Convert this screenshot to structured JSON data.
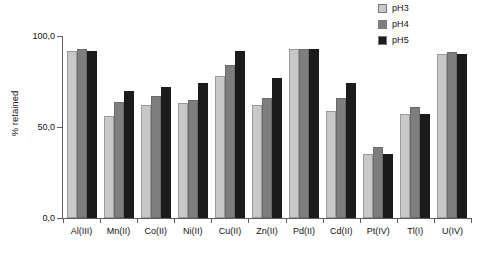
{
  "chart_data": {
    "type": "bar",
    "title": "",
    "xlabel": "",
    "ylabel": "% retained",
    "ylim": [
      0,
      100
    ],
    "ytick_labels": [
      "100,0",
      "50,0",
      "0,0"
    ],
    "ytick_values": [
      100,
      50,
      0
    ],
    "grid": false,
    "legend_position": "top-right",
    "categories": [
      "Al(III)",
      "Mn(II)",
      "Co(II)",
      "Ni(II)",
      "Cu(II)",
      "Zn(II)",
      "Pd(II)",
      "Cd(II)",
      "Pt(IV)",
      "Tl(I)",
      "U(IV)"
    ],
    "series": [
      {
        "name": "pH3",
        "color": "#c8c8c8",
        "values": [
          92,
          56,
          62,
          63,
          78,
          62,
          93,
          59,
          35,
          57,
          90
        ]
      },
      {
        "name": "pH4",
        "color": "#7e7e7e",
        "values": [
          93,
          64,
          67,
          65,
          84,
          66,
          93,
          66,
          39,
          61,
          91
        ]
      },
      {
        "name": "pH5",
        "color": "#1b1b1b",
        "values": [
          92,
          70,
          72,
          74,
          92,
          77,
          93,
          74,
          35,
          57,
          90
        ]
      }
    ]
  },
  "legend": {
    "items": [
      {
        "label": "pH3"
      },
      {
        "label": "pH4"
      },
      {
        "label": "pH5"
      }
    ]
  }
}
